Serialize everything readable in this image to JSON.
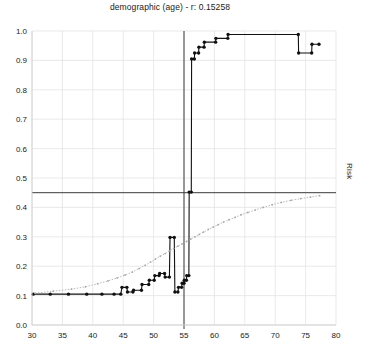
{
  "chart_data": {
    "type": "line",
    "title": "demographic (age) - r: 0.15258",
    "xlabel": "",
    "ylabel": "Risk",
    "right_axis_label": "Risk",
    "xlim": [
      30,
      80
    ],
    "ylim": [
      0.0,
      1.0
    ],
    "xticks": [
      30,
      35,
      40,
      45,
      50,
      55,
      60,
      65,
      70,
      75,
      80
    ],
    "yticks": [
      0.0,
      0.1,
      0.2,
      0.3,
      0.4,
      0.5,
      0.6,
      0.7,
      0.8,
      0.9,
      1.0
    ],
    "grid": true,
    "legend_position": "none",
    "annotations": {
      "vertical_reference_line_x": 55,
      "horizontal_reference_line_y": 0.45
    },
    "series": [
      {
        "name": "observed-step",
        "color": "#111111",
        "style": "step-with-markers",
        "points": [
          [
            30.2,
            0.105
          ],
          [
            33.0,
            0.105
          ],
          [
            36.0,
            0.105
          ],
          [
            39.0,
            0.105
          ],
          [
            41.5,
            0.105
          ],
          [
            43.5,
            0.105
          ],
          [
            44.6,
            0.105
          ],
          [
            44.8,
            0.128
          ],
          [
            45.6,
            0.128
          ],
          [
            45.7,
            0.112
          ],
          [
            46.6,
            0.112
          ],
          [
            46.7,
            0.118
          ],
          [
            48.0,
            0.118
          ],
          [
            48.1,
            0.138
          ],
          [
            49.2,
            0.138
          ],
          [
            49.3,
            0.152
          ],
          [
            50.1,
            0.152
          ],
          [
            50.2,
            0.168
          ],
          [
            50.9,
            0.168
          ],
          [
            51.0,
            0.175
          ],
          [
            51.8,
            0.175
          ],
          [
            51.9,
            0.163
          ],
          [
            52.6,
            0.163
          ],
          [
            52.7,
            0.298
          ],
          [
            53.4,
            0.298
          ],
          [
            53.5,
            0.112
          ],
          [
            54.0,
            0.112
          ],
          [
            54.1,
            0.128
          ],
          [
            54.6,
            0.128
          ],
          [
            54.7,
            0.142
          ],
          [
            55.0,
            0.142
          ],
          [
            55.05,
            0.152
          ],
          [
            55.4,
            0.152
          ],
          [
            55.45,
            0.168
          ],
          [
            55.8,
            0.168
          ],
          [
            55.85,
            0.452
          ],
          [
            56.2,
            0.452
          ],
          [
            56.25,
            0.905
          ],
          [
            56.7,
            0.905
          ],
          [
            56.75,
            0.925
          ],
          [
            57.4,
            0.925
          ],
          [
            57.45,
            0.945
          ],
          [
            58.3,
            0.945
          ],
          [
            58.35,
            0.962
          ],
          [
            60.2,
            0.962
          ],
          [
            60.25,
            0.975
          ],
          [
            62.2,
            0.975
          ],
          [
            62.25,
            0.988
          ],
          [
            73.8,
            0.988
          ],
          [
            73.85,
            0.925
          ],
          [
            76.0,
            0.925
          ],
          [
            76.05,
            0.955
          ],
          [
            77.2,
            0.955
          ]
        ]
      },
      {
        "name": "predicted-risk",
        "color": "#a8a8a8",
        "style": "dotted-with-markers",
        "points": [
          [
            30.5,
            0.108
          ],
          [
            33.5,
            0.115
          ],
          [
            36.5,
            0.122
          ],
          [
            38.8,
            0.13
          ],
          [
            40.8,
            0.14
          ],
          [
            42.5,
            0.15
          ],
          [
            44.0,
            0.16
          ],
          [
            45.3,
            0.17
          ],
          [
            46.5,
            0.18
          ],
          [
            47.6,
            0.192
          ],
          [
            48.6,
            0.203
          ],
          [
            49.5,
            0.214
          ],
          [
            50.3,
            0.224
          ],
          [
            51.1,
            0.234
          ],
          [
            51.9,
            0.243
          ],
          [
            52.6,
            0.252
          ],
          [
            53.3,
            0.26
          ],
          [
            54.0,
            0.268
          ],
          [
            54.7,
            0.276
          ],
          [
            55.4,
            0.284
          ],
          [
            56.1,
            0.292
          ],
          [
            56.8,
            0.3
          ],
          [
            57.5,
            0.308
          ],
          [
            58.2,
            0.316
          ],
          [
            59.0,
            0.325
          ],
          [
            59.8,
            0.333
          ],
          [
            60.6,
            0.341
          ],
          [
            61.5,
            0.35
          ],
          [
            62.4,
            0.358
          ],
          [
            63.4,
            0.366
          ],
          [
            64.4,
            0.375
          ],
          [
            65.5,
            0.383
          ],
          [
            66.7,
            0.391
          ],
          [
            68.0,
            0.4
          ],
          [
            69.5,
            0.409
          ],
          [
            71.0,
            0.417
          ],
          [
            72.6,
            0.424
          ],
          [
            74.2,
            0.43
          ],
          [
            75.8,
            0.435
          ],
          [
            77.3,
            0.44
          ]
        ]
      }
    ]
  },
  "caption": {
    "bottom_text": ""
  }
}
